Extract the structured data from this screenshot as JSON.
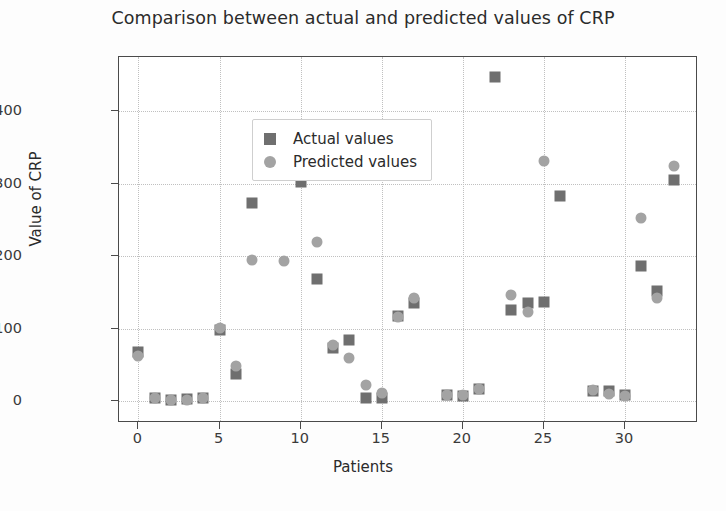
{
  "chart_data": {
    "type": "scatter",
    "title": "Comparison between actual and predicted values of CRP",
    "xlabel": "Patients",
    "ylabel": "Value of CRP",
    "xlim": [
      -1.2,
      34.5
    ],
    "ylim": [
      -30,
      475
    ],
    "xticks": [
      0,
      5,
      10,
      15,
      20,
      25,
      30
    ],
    "yticks": [
      0,
      100,
      200,
      300,
      400
    ],
    "grid": true,
    "legend_position": "upper left",
    "legend": [
      "Actual values",
      "Predicted values"
    ],
    "colors": {
      "actual": "#6f6f6f",
      "predicted": "#a3a3a3"
    },
    "x": [
      0,
      1,
      2,
      3,
      4,
      5,
      6,
      7,
      8,
      9,
      10,
      11,
      12,
      13,
      14,
      15,
      16,
      17,
      18,
      19,
      20,
      21,
      22,
      23,
      24,
      25,
      26,
      27,
      28,
      29,
      30,
      31,
      32,
      33
    ],
    "series": [
      {
        "name": "Actual values",
        "marker": "square",
        "values": [
          68,
          4,
          2,
          3,
          5,
          99,
          37,
          274,
          348,
          null,
          303,
          168,
          73,
          84,
          4,
          5,
          117,
          136,
          null,
          9,
          7,
          17,
          447,
          126,
          136,
          137,
          283,
          null,
          14,
          14,
          8,
          187,
          152,
          305
        ]
      },
      {
        "name": "Predicted values",
        "marker": "circle",
        "values": [
          63,
          5,
          2,
          2,
          5,
          101,
          48,
          195,
          330,
          194,
          318,
          220,
          78,
          60,
          23,
          12,
          116,
          142,
          null,
          8,
          9,
          17,
          null,
          147,
          123,
          331,
          null,
          null,
          16,
          10,
          7,
          253,
          142,
          325
        ]
      }
    ]
  }
}
